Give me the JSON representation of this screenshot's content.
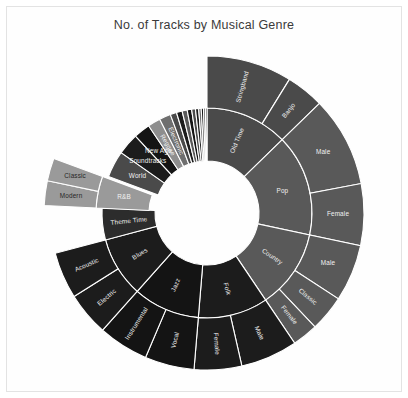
{
  "figure": {
    "title": "No. of Tracks by Musical Genre",
    "background": "#ffffff",
    "frame_color": "#e3e3e3",
    "title_color": "#3a3a3a"
  },
  "geometry": {
    "cx": 207,
    "cy": 213,
    "r_hole": 52,
    "r_mid": 105,
    "r_out": 157,
    "start_angle_deg": 0,
    "callout_gap": 6
  },
  "palette": {
    "dark_gray": "#4a4a4a",
    "mid_gray": "#595959",
    "light_gray": "#9a9a9a",
    "pale_gray": "#8e8e8e",
    "near_black": "#1c1c1c",
    "black": "#141414",
    "charcoal": "#2c2c2c",
    "soft_gray": "#6f6f6f",
    "label_light": "#f2f2f2",
    "label_dark": "#262626"
  },
  "chart_data": {
    "type": "pie",
    "subtype": "sunburst",
    "title": "No. of Tracks by Musical Genre",
    "subtitle": "",
    "xlabel": "",
    "ylabel": "",
    "legend": false,
    "grid": false,
    "total_value": 100,
    "rings": [
      "genre",
      "subgenre"
    ],
    "note": "Two-level sunburst; inner ring = genre, outer ring = subgenre. Values are percent of total tracks, read from arc sweep.",
    "nodes": [
      {
        "label": "Old Time",
        "value": 13.0,
        "color": "#4a4a4a",
        "label_rotate": true,
        "children": [
          {
            "label": "Stringband",
            "value": 9.0,
            "color": "#4a4a4a",
            "label_rotate": true
          },
          {
            "label": "Banjo",
            "value": 4.0,
            "color": "#4a4a4a",
            "label_rotate": true
          }
        ]
      },
      {
        "label": "Pop",
        "value": 16.0,
        "color": "#595959",
        "label_rotate": false,
        "children": [
          {
            "label": "Male",
            "value": 9.5,
            "color": "#595959",
            "label_rotate": false
          },
          {
            "label": "Female",
            "value": 6.5,
            "color": "#595959",
            "label_rotate": false
          }
        ]
      },
      {
        "label": "Country",
        "value": 12.5,
        "color": "#595959",
        "label_rotate": true,
        "children": [
          {
            "label": "Male",
            "value": 6.0,
            "color": "#595959",
            "label_rotate": false
          },
          {
            "label": "Classic",
            "value": 3.8,
            "color": "#595959",
            "label_rotate": true
          },
          {
            "label": "Female",
            "value": 2.7,
            "color": "#595959",
            "label_rotate": true
          }
        ]
      },
      {
        "label": "Folk",
        "value": 11.0,
        "color": "#1c1c1c",
        "label_rotate": true,
        "children": [
          {
            "label": "Male",
            "value": 6.0,
            "color": "#1c1c1c",
            "label_rotate": true
          },
          {
            "label": "Female",
            "value": 5.0,
            "color": "#1c1c1c",
            "label_rotate": true
          }
        ]
      },
      {
        "label": "Jazz",
        "value": 10.5,
        "color": "#141414",
        "label_rotate": true,
        "children": [
          {
            "label": "Vocal",
            "value": 5.2,
            "color": "#141414",
            "label_rotate": true
          },
          {
            "label": "Instrumental",
            "value": 5.3,
            "color": "#141414",
            "label_rotate": true
          }
        ]
      },
      {
        "label": "Blues",
        "value": 9.5,
        "color": "#1c1c1c",
        "label_rotate": true,
        "children": [
          {
            "label": "Electric",
            "value": 4.6,
            "color": "#1c1c1c",
            "label_rotate": true
          },
          {
            "label": "Acoustic",
            "value": 4.9,
            "color": "#1c1c1c",
            "label_rotate": true
          }
        ]
      },
      {
        "label": "Theme Time",
        "value": 5.0,
        "color": "#2c2c2c",
        "label_rotate": true,
        "children": []
      },
      {
        "label": "R&B",
        "value": 5.0,
        "color": "#9a9a9a",
        "label_rotate": false,
        "callout": true,
        "children": [
          {
            "label": "Modern",
            "value": 2.6,
            "color": "#9a9a9a",
            "label_rotate": false,
            "callout": true,
            "dark_text": true
          },
          {
            "label": "Classic",
            "value": 2.4,
            "color": "#9a9a9a",
            "label_rotate": false,
            "callout": true,
            "dark_text": true
          }
        ]
      },
      {
        "label": "World",
        "value": 4.2,
        "color": "#4a4a4a",
        "label_rotate": false,
        "children": []
      },
      {
        "label": "Soundtracks",
        "value": 3.4,
        "color": "#1c1c1c",
        "label_rotate": false,
        "children": []
      },
      {
        "label": "New Age",
        "value": 2.6,
        "color": "#141414",
        "label_rotate": false,
        "children": []
      },
      {
        "label": "Reggae",
        "value": 2.0,
        "color": "#8e8e8e",
        "label_rotate": true,
        "children": []
      },
      {
        "label": "Electronic",
        "value": 1.8,
        "color": "#6f6f6f",
        "label_rotate": true,
        "children": []
      },
      {
        "label": "",
        "value": 1.0,
        "color": "#4a4a4a",
        "label_rotate": true,
        "children": []
      },
      {
        "label": "",
        "value": 0.9,
        "color": "#1c1c1c",
        "label_rotate": true,
        "children": []
      },
      {
        "label": "",
        "value": 0.8,
        "color": "#595959",
        "label_rotate": true,
        "children": []
      },
      {
        "label": "",
        "value": 0.7,
        "color": "#141414",
        "label_rotate": true,
        "children": []
      },
      {
        "label": "",
        "value": 0.6,
        "color": "#4a4a4a",
        "label_rotate": true,
        "children": []
      },
      {
        "label": "",
        "value": 0.5,
        "color": "#1c1c1c",
        "label_rotate": true,
        "children": []
      },
      {
        "label": "",
        "value": 0.4,
        "color": "#6f6f6f",
        "label_rotate": true,
        "children": []
      },
      {
        "label": "",
        "value": 0.35,
        "color": "#141414",
        "label_rotate": true,
        "children": []
      },
      {
        "label": "",
        "value": 0.3,
        "color": "#595959",
        "label_rotate": true,
        "children": []
      },
      {
        "label": "",
        "value": 0.25,
        "color": "#2c2c2c",
        "label_rotate": true,
        "children": []
      }
    ]
  }
}
